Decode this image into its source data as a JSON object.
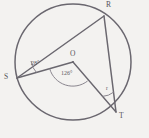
{
  "diagram": {
    "kind": "circle-geometry",
    "background_color": "#f3f2f0",
    "stroke_color": "#6a676f",
    "label_color": "#55525a",
    "circle": {
      "cx": 73,
      "cy": 62,
      "r": 58,
      "center_label": "O"
    },
    "vertices": [
      {
        "name": "R",
        "label": "R",
        "x": 104,
        "y": 16,
        "label_x": 106,
        "label_y": 2
      },
      {
        "name": "S",
        "label": "S",
        "x": 17,
        "y": 78,
        "label_x": 5,
        "label_y": 75
      },
      {
        "name": "T",
        "label": "T",
        "x": 116,
        "y": 112,
        "label_x": 119,
        "label_y": 113
      }
    ],
    "segments": [
      {
        "name": "chord-SR",
        "from": "S",
        "to": "R"
      },
      {
        "name": "chord-RT",
        "from": "R",
        "to": "T"
      },
      {
        "name": "radius-OS",
        "from": "O",
        "to": "S"
      },
      {
        "name": "radius-OT",
        "from": "O",
        "to": "T"
      }
    ],
    "angles": [
      {
        "name": "angle-at-S",
        "vertex": "S",
        "value": "28°",
        "label_x": 31,
        "label_y": 63
      },
      {
        "name": "angle-at-O",
        "vertex": "O",
        "value": "126°",
        "label_x": 62,
        "label_y": 73
      },
      {
        "name": "angle-at-T",
        "vertex": "T",
        "value": "r",
        "label_x": 106,
        "label_y": 88
      }
    ]
  }
}
